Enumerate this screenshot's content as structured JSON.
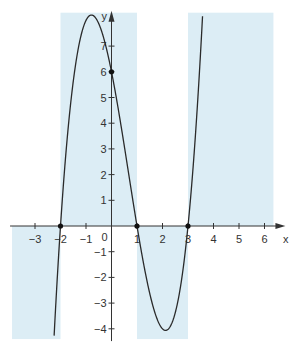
{
  "chart_data": {
    "type": "line",
    "title": "",
    "xlabel": "x",
    "ylabel": "y",
    "origin_label": "0",
    "function": "f(x) = (x+2)(x-1)(x-3) = x^3 - 2x^2 - 5x + 6",
    "coefficients": [
      1,
      -2,
      -5,
      6
    ],
    "xlim": [
      -3.9,
      6.35
    ],
    "ylim": [
      -4.4,
      8.3
    ],
    "x_ticks": [
      -3,
      -2,
      -1,
      1,
      2,
      3,
      4,
      5,
      6
    ],
    "x_tick_labels": [
      "-3",
      "-2",
      "-1",
      "1",
      "2",
      "3",
      "4",
      "5",
      "6"
    ],
    "y_ticks": [
      -4,
      -3,
      -2,
      -1,
      1,
      2,
      3,
      4,
      5,
      6,
      7
    ],
    "y_tick_labels": [
      "-4",
      "-3",
      "-2",
      "-1",
      "1",
      "2",
      "3",
      "4",
      "5",
      "6",
      "7"
    ],
    "marked_points": [
      {
        "x": -2,
        "y": 0
      },
      {
        "x": 1,
        "y": 0
      },
      {
        "x": 3,
        "y": 0
      },
      {
        "x": 0,
        "y": 6
      }
    ],
    "shaded_regions": [
      {
        "x": [
          -3.9,
          -2
        ],
        "y": [
          -4.4,
          0
        ]
      },
      {
        "x": [
          -2,
          1
        ],
        "y": [
          0,
          8.3
        ]
      },
      {
        "x": [
          1,
          3
        ],
        "y": [
          -4.4,
          0
        ]
      },
      {
        "x": [
          3,
          6.35
        ],
        "y": [
          0,
          8.3
        ]
      }
    ],
    "colors": {
      "shade": "#dcedf5",
      "curve": "#2a2a2a",
      "axis": "#333333"
    },
    "grid": false,
    "legend": "none"
  }
}
